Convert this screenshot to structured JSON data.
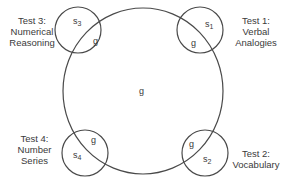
{
  "diagram": {
    "central": {
      "label": "g"
    },
    "tests": [
      {
        "id": "test1",
        "title": "Test 1:",
        "name_lines": [
          "Verbal",
          "Analogies"
        ],
        "specific": "s",
        "sub": "1",
        "general": "g"
      },
      {
        "id": "test2",
        "title": "Test 2:",
        "name_lines": [
          "Vocabulary"
        ],
        "specific": "s",
        "sub": "2",
        "general": "g"
      },
      {
        "id": "test3",
        "title": "Test 3:",
        "name_lines": [
          "Numerical",
          "Reasoning"
        ],
        "specific": "s",
        "sub": "3",
        "general": "g"
      },
      {
        "id": "test4",
        "title": "Test 4:",
        "name_lines": [
          "Number",
          "Series"
        ],
        "specific": "s",
        "sub": "4",
        "general": "g"
      }
    ],
    "colors": {
      "stroke": "#4a4a4a",
      "text": "#3a3a3a"
    }
  }
}
